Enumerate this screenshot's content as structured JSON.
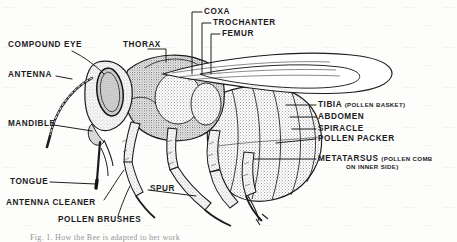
{
  "figure": {
    "style": "black and white stippled line engraving",
    "background_color": "#fdfdfc",
    "ink_color": "#1c1c1c"
  },
  "labels": {
    "compound_eye": "COMPOUND EYE",
    "antenna": "ANTENNA",
    "mandible": "MANDIBLE",
    "tongue": "TONGUE",
    "antenna_cleaner": "ANTENNA CLEANER",
    "pollen_brushes": "POLLEN BRUSHES",
    "spur": "SPUR",
    "thorax": "THORAX",
    "coxa": "COXA",
    "trochanter": "TROCHANTER",
    "femur": "FEMUR",
    "tibia": "TIBIA",
    "tibia_note": "(POLLEN BASKET)",
    "abdomen": "ABDOMEN",
    "spiracle": "SPIRACLE",
    "pollen_packer": "POLLEN PACKER",
    "metatarsus": "METATARSUS",
    "metatarsus_note": "(POLLEN COMB",
    "metatarsus_note2": "ON INNER SIDE)"
  },
  "caption": {
    "text": "Fig. 1.  How the Bee is adapted to her work"
  }
}
